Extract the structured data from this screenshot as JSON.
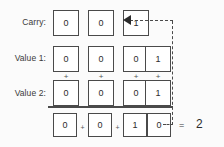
{
  "diagram": {
    "colors": {
      "box_border": "#4a4a4a",
      "box_fill": "#ffffff",
      "text": "#2c2c2c",
      "dashed_line": "#4a4a4a",
      "background": "#fbfbfb"
    },
    "rows": [
      {
        "id": "carry",
        "label": "Carry:",
        "bits": [
          "0",
          "0",
          "1"
        ],
        "columns": [
          1,
          2,
          3
        ]
      },
      {
        "id": "value1",
        "label": "Value 1:",
        "bits": [
          "0",
          "0",
          "0",
          "1"
        ],
        "columns": [
          1,
          2,
          3,
          4
        ]
      },
      {
        "id": "value2",
        "label": "Value 2:",
        "bits": [
          "0",
          "0",
          "0",
          "1"
        ],
        "columns": [
          1,
          2,
          3,
          4
        ]
      },
      {
        "id": "result",
        "label": "",
        "bits": [
          "0",
          "0",
          "1",
          "0"
        ],
        "columns": [
          1,
          2,
          3,
          4
        ]
      }
    ],
    "operators": {
      "between_values": [
        "+",
        "+",
        "+",
        "+"
      ],
      "between_result_bits": [
        "+",
        "+",
        "+"
      ],
      "equals": "="
    },
    "total": "2",
    "carry_feedback": {
      "arrow": "left-arrow-icon",
      "style": "dashed"
    }
  }
}
